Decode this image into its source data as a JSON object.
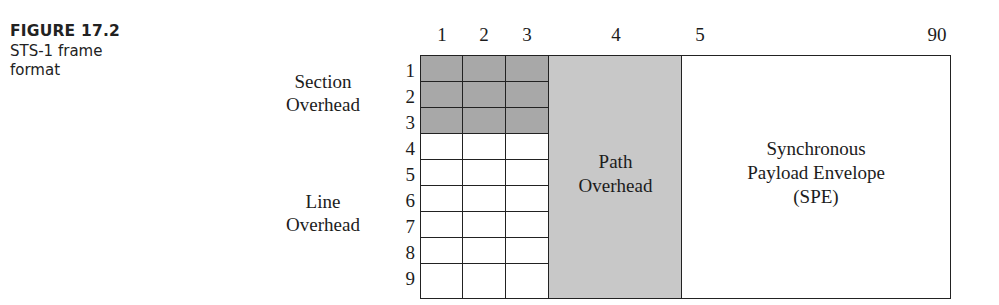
{
  "caption": {
    "figure_label": "FIGURE 17.2",
    "description": "STS-1 frame format"
  },
  "diagram": {
    "column_labels": [
      "1",
      "2",
      "3",
      "4",
      "5",
      "90"
    ],
    "row_labels": [
      "1",
      "2",
      "3",
      "4",
      "5",
      "6",
      "7",
      "8",
      "9"
    ],
    "groups": {
      "section_overhead": [
        "Section",
        "Overhead"
      ],
      "line_overhead": [
        "Line",
        "Overhead"
      ]
    },
    "blocks": {
      "path_overhead": [
        "Path",
        "Overhead"
      ],
      "spe": [
        "Synchronous",
        "Payload Envelope",
        "(SPE)"
      ]
    },
    "colors": {
      "section_overhead_fill": "#a8a8a8",
      "path_overhead_fill": "#c8c8c8",
      "line_overhead_fill": "#ffffff",
      "border": "#222222"
    }
  }
}
